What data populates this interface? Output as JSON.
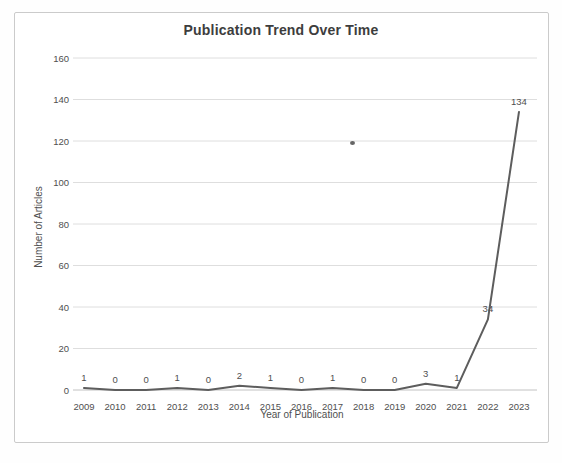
{
  "chart_data": {
    "type": "line",
    "title": "Publication Trend Over Time",
    "xlabel": "Year of Publication",
    "ylabel": "Number of Articles",
    "categories": [
      "2009",
      "2010",
      "2011",
      "2012",
      "2013",
      "2014",
      "2015",
      "2016",
      "2017",
      "2018",
      "2019",
      "2020",
      "2021",
      "2022",
      "2023"
    ],
    "values": [
      1,
      0,
      0,
      1,
      0,
      2,
      1,
      0,
      1,
      0,
      0,
      3,
      1,
      34,
      134
    ],
    "ylim": [
      0,
      160
    ],
    "ytick_step": 20,
    "yticks": [
      0,
      20,
      40,
      60,
      80,
      100,
      120,
      140,
      160
    ],
    "grid": "horizontal",
    "legend": "none",
    "data_labels": true,
    "colors": {
      "line": "#5d5d5d",
      "grid": "#dedede",
      "axis_line": "#c2c2c2",
      "text": "#4f4f4f",
      "title_text": "#3d3d3d",
      "frame_border": "#cbcbcb"
    }
  }
}
